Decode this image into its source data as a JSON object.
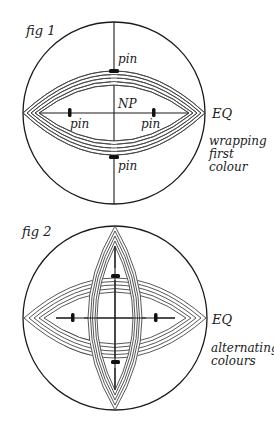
{
  "figures": [
    {
      "id": "fig1",
      "title": "fig 1",
      "center_label": "NP",
      "equator_label": "EQ",
      "caption_lines": [
        "wrapping",
        "first",
        "colour"
      ],
      "pin_label": "pin",
      "pins": [
        {
          "position": "top",
          "label": "pin"
        },
        {
          "position": "bottom",
          "label": "pin"
        },
        {
          "position": "left",
          "label": "pin"
        },
        {
          "position": "right",
          "label": "pin"
        }
      ],
      "bands": [
        {
          "orientation": "horizontal",
          "threads": 5
        }
      ]
    },
    {
      "id": "fig2",
      "title": "fig 2",
      "equator_label": "EQ",
      "caption_lines": [
        "alternating",
        "colours"
      ],
      "pins": [
        {
          "position": "top"
        },
        {
          "position": "bottom"
        },
        {
          "position": "left"
        },
        {
          "position": "right"
        }
      ],
      "bands": [
        {
          "orientation": "horizontal",
          "threads": 5
        },
        {
          "orientation": "vertical",
          "threads": 5
        }
      ]
    }
  ],
  "colors": {
    "ink": "#1a1a1a",
    "thread": "#444444",
    "background": "#ffffff"
  }
}
